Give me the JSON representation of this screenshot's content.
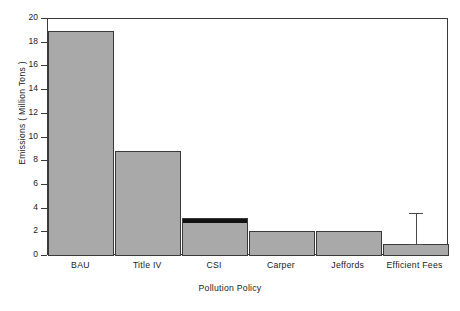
{
  "chart_data": {
    "type": "bar",
    "title": "",
    "xlabel": "Pollution Policy",
    "ylabel": "Emissions ( Million Tons )",
    "categories": [
      "BAU",
      "Title IV",
      "CSI",
      "Carper",
      "Jeffords",
      "Efficient Fees"
    ],
    "values": [
      19.0,
      8.9,
      3.2,
      2.1,
      2.1,
      1.0
    ],
    "series": [
      {
        "name": "Emissions",
        "values": [
          19.0,
          8.9,
          3.2,
          2.1,
          2.1,
          1.0
        ]
      }
    ],
    "segment_overlay": {
      "note": "dark cap segment on CSI bar",
      "category": "CSI",
      "from": 2.9,
      "to": 3.2,
      "color": "#121212"
    },
    "error_bars": [
      {
        "category": "Efficient Fees",
        "value": 1.0,
        "upper": 3.6,
        "lower": 1.0
      }
    ],
    "ylim": [
      0,
      20
    ],
    "yticks": [
      0,
      2,
      4,
      6,
      8,
      10,
      12,
      14,
      16,
      18,
      20
    ],
    "ytick_labels": [
      "0",
      "2",
      "4",
      "6",
      "8",
      "10",
      "12",
      "14",
      "16",
      "18",
      "20"
    ],
    "grid": false,
    "legend": "none",
    "bar_fill_color": "#a9a9a9",
    "bar_edge_color": "#3a3a3a",
    "axis_color": "#3a3a3a",
    "background_color": "#ffffff"
  },
  "caption_partial": ""
}
